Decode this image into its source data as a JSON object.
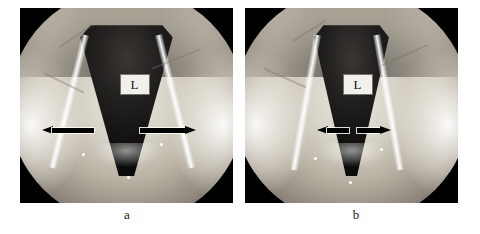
{
  "figure": {
    "type": "laryngoscopy-photograph-pair",
    "background_color": "#ffffff",
    "frame_border_color": "#000000"
  },
  "panels": [
    {
      "id": "a",
      "caption": "a",
      "label": "L",
      "label_name": "lumen-label",
      "arrows": [
        {
          "direction": "left",
          "name": "left-pointing-arrow",
          "color": "#000000"
        },
        {
          "direction": "right",
          "name": "right-pointing-arrow",
          "color": "#000000"
        }
      ],
      "arrow_color": "#000000",
      "description": "Endoscopic view of larynx with widely abducted vocal cords and a broad dark triangular glottic airway."
    },
    {
      "id": "b",
      "caption": "b",
      "label": "L",
      "label_name": "lumen-label",
      "arrows": [
        {
          "direction": "left",
          "name": "left-pointing-arrow",
          "color": "#000000"
        },
        {
          "direction": "right",
          "name": "right-pointing-arrow",
          "color": "#000000"
        }
      ],
      "arrow_color": "#000000",
      "description": "Endoscopic view of larynx with a narrowed glottic airway; the paired arrows span a shorter distance."
    }
  ],
  "colors": {
    "page_background": "#ffffff",
    "image_dark": "#0c0b0b",
    "tissue_light": "#f2efe8",
    "annotation": "#000000",
    "label_box": "#f2f0ea",
    "caption_text": "#1a1a1a"
  }
}
